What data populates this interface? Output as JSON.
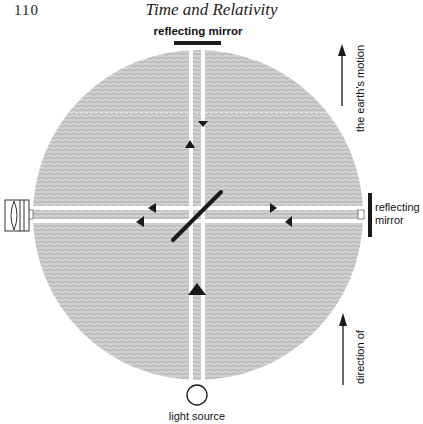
{
  "page": {
    "number": "110",
    "running_title": "Time and Relativity"
  },
  "diagram": {
    "labels": {
      "top_mirror": "reflecting mirror",
      "right_mirror_line1": "reflecting",
      "right_mirror_line2": "mirror",
      "light_source": "light source",
      "motion_upper": "the earth's motion",
      "motion_lower": "direction of"
    },
    "components": [
      {
        "name": "light-source",
        "shape": "circle"
      },
      {
        "name": "half-silvered-mirror",
        "shape": "diagonal-bar"
      },
      {
        "name": "top-reflecting-mirror",
        "shape": "bar"
      },
      {
        "name": "right-reflecting-mirror",
        "shape": "bar"
      },
      {
        "name": "telescope-eyepiece",
        "shape": "lens-box"
      }
    ],
    "colors": {
      "disc": "#c9c9c9",
      "ink": "#1a1a1a",
      "beam": "#ffffff"
    }
  }
}
